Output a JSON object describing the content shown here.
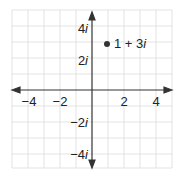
{
  "diagram": {
    "type": "complex-plane",
    "grid": {
      "x_min": -5,
      "x_max": 5,
      "y_min": -5,
      "y_max": 5,
      "step": 1
    },
    "x_axis": {
      "ticks": [
        {
          "value": -4,
          "label": "−4"
        },
        {
          "value": -2,
          "label": "−2"
        },
        {
          "value": 2,
          "label": "2"
        },
        {
          "value": 4,
          "label": "4"
        }
      ]
    },
    "y_axis": {
      "ticks": [
        {
          "value": 4,
          "num": "4",
          "unit": "i"
        },
        {
          "value": 2,
          "num": "2",
          "unit": "i"
        },
        {
          "value": -2,
          "num": "−2",
          "unit": "i"
        },
        {
          "value": -4,
          "num": "−4",
          "unit": "i"
        }
      ]
    },
    "points": [
      {
        "re": 1,
        "im": 3,
        "label_main": "1 + 3",
        "label_unit": "i"
      }
    ],
    "colors": {
      "grid": "#dcdcdc",
      "axis": "#333333",
      "point": "#333333",
      "text": "#222222"
    }
  }
}
